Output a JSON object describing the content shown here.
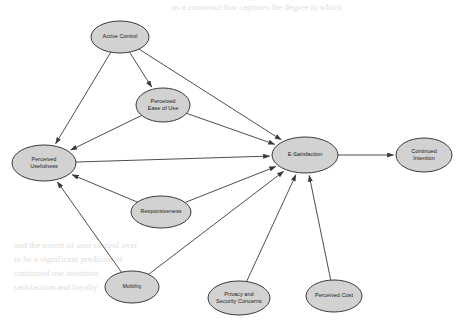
{
  "diagram": {
    "background_color": "#ffffff",
    "node_fill": "#d2d2d2",
    "node_stroke": "#3a3a3a",
    "edge_color": "#3a3a3a",
    "nodes": [
      {
        "id": "active_control",
        "label": "Active Control",
        "lines": [
          "Active Control"
        ],
        "cx": 120,
        "cy": 37,
        "rx": 29,
        "ry": 16
      },
      {
        "id": "perceived_eou",
        "label": "Perceived Ease of Use",
        "lines": [
          "Perceived",
          "Ease of Use"
        ],
        "cx": 163,
        "cy": 105,
        "rx": 27,
        "ry": 17
      },
      {
        "id": "perceived_use",
        "label": "Perceived Usefulness",
        "lines": [
          "Perceived",
          "Usefulness"
        ],
        "cx": 44,
        "cy": 163,
        "rx": 32,
        "ry": 18
      },
      {
        "id": "responsiveness",
        "label": "Responsiveness",
        "lines": [
          "Responsiveness"
        ],
        "cx": 161,
        "cy": 212,
        "rx": 30,
        "ry": 16
      },
      {
        "id": "mobility",
        "label": "Mobility",
        "lines": [
          "Mobility"
        ],
        "cx": 132,
        "cy": 287,
        "rx": 27,
        "ry": 16
      },
      {
        "id": "privacy_security",
        "label": "Privacy and Security Concerns",
        "lines": [
          "Privacy and",
          "Security Concerns"
        ],
        "cx": 239,
        "cy": 298,
        "rx": 31,
        "ry": 17
      },
      {
        "id": "perceived_cost",
        "label": "Perceived Cost",
        "lines": [
          "Perceived Cost"
        ],
        "cx": 334,
        "cy": 296,
        "rx": 28,
        "ry": 16
      },
      {
        "id": "e_satisfaction",
        "label": "E-Satisfaction",
        "lines": [
          "E-Satisfaction"
        ],
        "cx": 305,
        "cy": 155,
        "rx": 33,
        "ry": 18
      },
      {
        "id": "continued_intent",
        "label": "Continued Intention",
        "lines": [
          "Continued",
          "Intention"
        ],
        "cx": 424,
        "cy": 155,
        "rx": 28,
        "ry": 17
      }
    ],
    "edges": [
      {
        "from": "active_control",
        "to": "perceived_use"
      },
      {
        "from": "active_control",
        "to": "perceived_eou"
      },
      {
        "from": "active_control",
        "to": "e_satisfaction"
      },
      {
        "from": "perceived_eou",
        "to": "perceived_use"
      },
      {
        "from": "perceived_eou",
        "to": "e_satisfaction"
      },
      {
        "from": "perceived_use",
        "to": "e_satisfaction"
      },
      {
        "from": "responsiveness",
        "to": "perceived_use"
      },
      {
        "from": "responsiveness",
        "to": "e_satisfaction"
      },
      {
        "from": "mobility",
        "to": "perceived_use"
      },
      {
        "from": "mobility",
        "to": "e_satisfaction"
      },
      {
        "from": "privacy_security",
        "to": "e_satisfaction"
      },
      {
        "from": "perceived_cost",
        "to": "e_satisfaction"
      },
      {
        "from": "e_satisfaction",
        "to": "continued_intent"
      }
    ],
    "background_bleed_lines": [
      {
        "text": "as a construct that captures the degree to which",
        "x": 172,
        "y": 10,
        "size": 9
      },
      {
        "text": "and the extent of user control over",
        "x": 14,
        "y": 248,
        "size": 9
      },
      {
        "text": "to be a significant predictor of",
        "x": 14,
        "y": 262,
        "size": 9
      },
      {
        "text": "continued use intention",
        "x": 14,
        "y": 276,
        "size": 9
      },
      {
        "text": "satisfaction and loyalty",
        "x": 14,
        "y": 290,
        "size": 9
      }
    ]
  }
}
